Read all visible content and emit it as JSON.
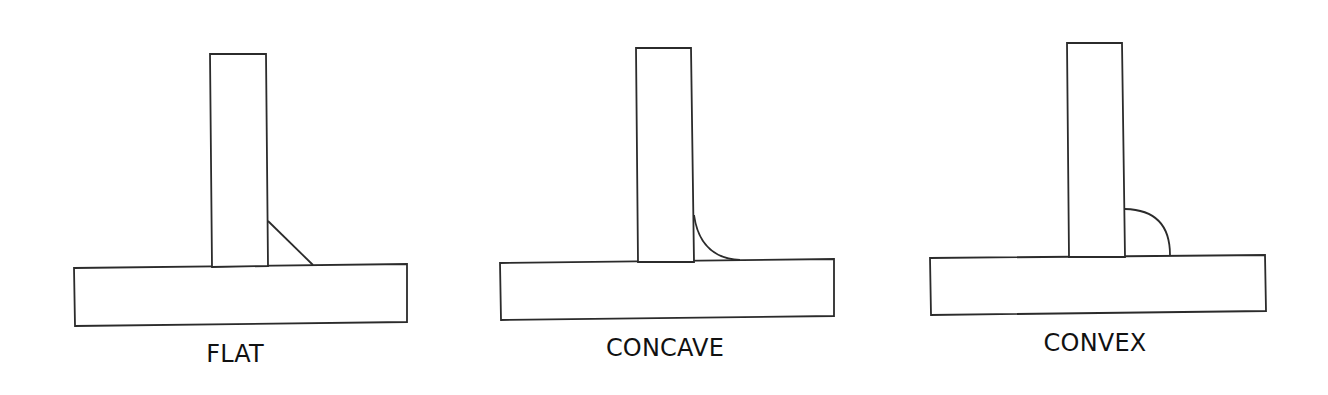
{
  "diagram": {
    "colors": {
      "background": "#ffffff",
      "line": "#2b2b2b",
      "text": "#111111"
    },
    "joints": [
      {
        "id": "flat",
        "label": "FLAT",
        "weld_profile": "flat",
        "base_plate": [
          [
            74,
            268
          ],
          [
            407,
            264
          ],
          [
            407,
            322
          ],
          [
            75,
            326
          ]
        ],
        "vertical_plate": [
          [
            210,
            54
          ],
          [
            266,
            54
          ],
          [
            268,
            266
          ],
          [
            212,
            267
          ]
        ],
        "weld_path": "M 268 221 L 313 265",
        "label_pos": [
          235,
          362
        ]
      },
      {
        "id": "concave",
        "label": "CONCAVE",
        "weld_profile": "concave",
        "base_plate": [
          [
            500,
            263
          ],
          [
            834,
            259
          ],
          [
            834,
            316
          ],
          [
            501,
            320
          ]
        ],
        "vertical_plate": [
          [
            636,
            48
          ],
          [
            691,
            48
          ],
          [
            694,
            262
          ],
          [
            638,
            262
          ]
        ],
        "weld_path": "M 694 215 Q 700 258 740 260",
        "label_pos": [
          665,
          356
        ]
      },
      {
        "id": "convex",
        "label": "CONVEX",
        "weld_profile": "convex",
        "base_plate": [
          [
            930,
            258
          ],
          [
            1265,
            255
          ],
          [
            1266,
            311
          ],
          [
            931,
            315
          ]
        ],
        "vertical_plate": [
          [
            1067,
            43
          ],
          [
            1122,
            43
          ],
          [
            1125,
            257
          ],
          [
            1069,
            257
          ]
        ],
        "weld_path": "M 1125 209 Q 1170 210 1170 255",
        "label_pos": [
          1095,
          351
        ]
      }
    ]
  }
}
